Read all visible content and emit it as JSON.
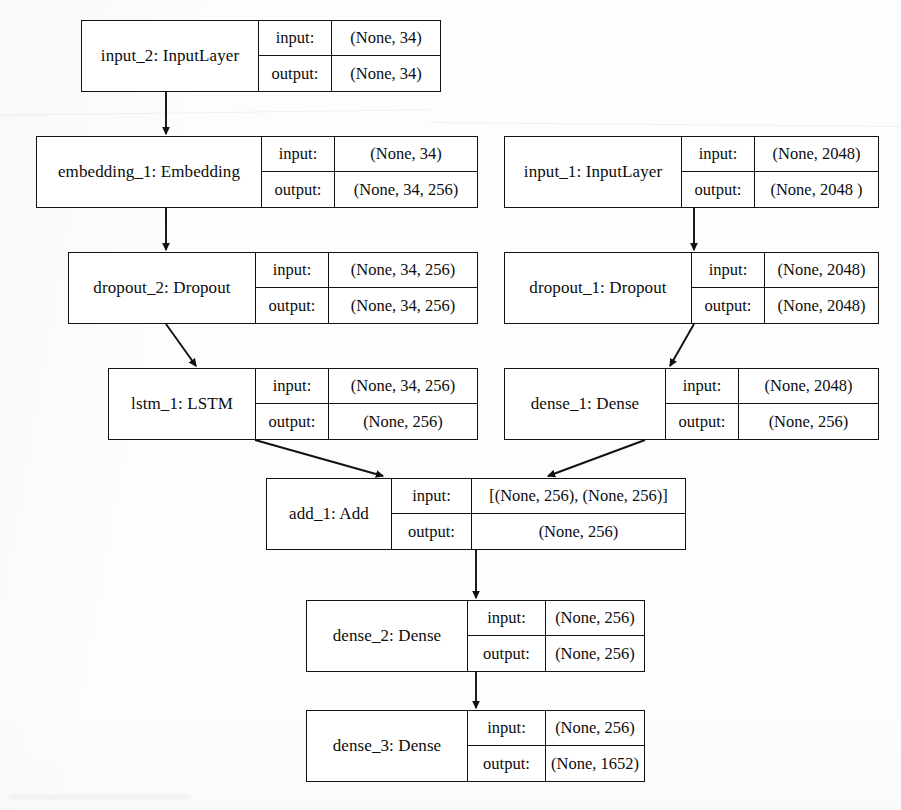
{
  "diagram": {
    "type": "neural-network-architecture",
    "row_labels": {
      "input": "input:",
      "output": "output:"
    },
    "nodes": [
      {
        "id": "input_2",
        "label": "input_2: InputLayer",
        "input": "(None, 34)",
        "output": "(None, 34)",
        "x": 81,
        "y": 20,
        "w": 360,
        "h": 72,
        "name_w": 176,
        "key_w": 73
      },
      {
        "id": "embedding_1",
        "label": "embedding_1: Embedding",
        "input": "(None, 34)",
        "output": "(None, 34, 256)",
        "x": 36,
        "y": 136,
        "w": 442,
        "h": 72,
        "name_w": 224,
        "key_w": 73
      },
      {
        "id": "input_1",
        "label": "input_1: InputLayer",
        "input": "(None, 2048)",
        "output": "(None, 2048 )",
        "x": 504,
        "y": 136,
        "w": 375,
        "h": 72,
        "name_w": 176,
        "key_w": 73
      },
      {
        "id": "dropout_2",
        "label": "dropout_2: Dropout",
        "input": "(None, 34, 256)",
        "output": "(None, 34, 256)",
        "x": 68,
        "y": 252,
        "w": 410,
        "h": 72,
        "name_w": 186,
        "key_w": 73
      },
      {
        "id": "dropout_1",
        "label": "dropout_1: Dropout",
        "input": "(None, 2048)",
        "output": "(None, 2048)",
        "x": 504,
        "y": 252,
        "w": 375,
        "h": 72,
        "name_w": 186,
        "key_w": 73
      },
      {
        "id": "lstm_1",
        "label": "lstm_1: LSTM",
        "input": "(None, 34, 256)",
        "output": "(None, 256)",
        "x": 108,
        "y": 368,
        "w": 370,
        "h": 72,
        "name_w": 146,
        "key_w": 73
      },
      {
        "id": "dense_1",
        "label": "dense_1: Dense",
        "input": "(None, 2048)",
        "output": "(None, 256)",
        "x": 504,
        "y": 368,
        "w": 375,
        "h": 72,
        "name_w": 160,
        "key_w": 73
      },
      {
        "id": "add_1",
        "label": "add_1: Add",
        "input": "[(None, 256), (None, 256)]",
        "output": "(None, 256)",
        "x": 266,
        "y": 478,
        "w": 420,
        "h": 72,
        "name_w": 124,
        "key_w": 80
      },
      {
        "id": "dense_2",
        "label": "dense_2: Dense",
        "input": "(None, 256)",
        "output": "(None, 256)",
        "x": 306,
        "y": 600,
        "w": 339,
        "h": 72,
        "name_w": 160,
        "key_w": 78
      },
      {
        "id": "dense_3",
        "label": "dense_3: Dense",
        "input": "(None, 256)",
        "output": "(None, 1652)",
        "x": 306,
        "y": 710,
        "w": 339,
        "h": 72,
        "name_w": 160,
        "key_w": 78
      }
    ],
    "edges": [
      {
        "from": "input_2",
        "to": "embedding_1",
        "x1": 166,
        "y1": 92,
        "x2": 166,
        "y2": 134
      },
      {
        "from": "embedding_1",
        "to": "dropout_2",
        "x1": 166,
        "y1": 208,
        "x2": 166,
        "y2": 250
      },
      {
        "from": "input_1",
        "to": "dropout_1",
        "x1": 694,
        "y1": 208,
        "x2": 694,
        "y2": 250
      },
      {
        "from": "dropout_2",
        "to": "lstm_1",
        "x1": 166,
        "y1": 324,
        "x2": 196,
        "y2": 366
      },
      {
        "from": "dropout_1",
        "to": "dense_1",
        "x1": 694,
        "y1": 324,
        "x2": 670,
        "y2": 366
      },
      {
        "from": "lstm_1",
        "to": "add_1",
        "x1": 255,
        "y1": 440,
        "x2": 383,
        "y2": 476
      },
      {
        "from": "dense_1",
        "to": "add_1",
        "x1": 645,
        "y1": 440,
        "x2": 548,
        "y2": 476
      },
      {
        "from": "add_1",
        "to": "dense_2",
        "x1": 476,
        "y1": 550,
        "x2": 476,
        "y2": 598
      },
      {
        "from": "dense_2",
        "to": "dense_3",
        "x1": 476,
        "y1": 672,
        "x2": 476,
        "y2": 708
      }
    ]
  },
  "style": {
    "stroke": "#111111",
    "box_fill": "#ffffff",
    "page_bg": "#fdfdfd"
  }
}
